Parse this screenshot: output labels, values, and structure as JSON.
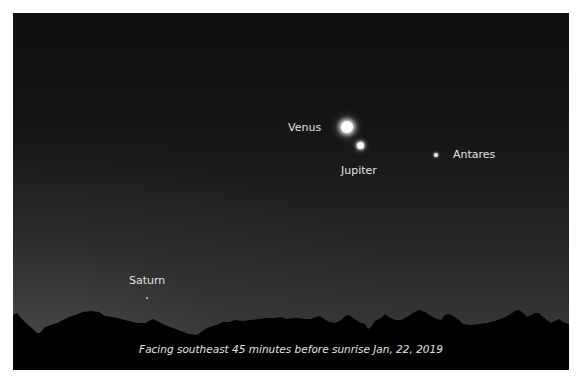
{
  "scene": {
    "description": "Pre-dawn sky with planets above a dark tree-line horizon",
    "sky_colors": {
      "top": "#0f0f0f",
      "horizon": "#3a3a3a",
      "bottom_left_glow": "#5a5a5a"
    },
    "horizon_color": "#000000"
  },
  "labels": {
    "venus": "Venus",
    "jupiter": "Jupiter",
    "antares": "Antares",
    "saturn": "Saturn"
  },
  "caption": "Facing southeast 45 minutes before sunrise Jan, 22, 2019"
}
